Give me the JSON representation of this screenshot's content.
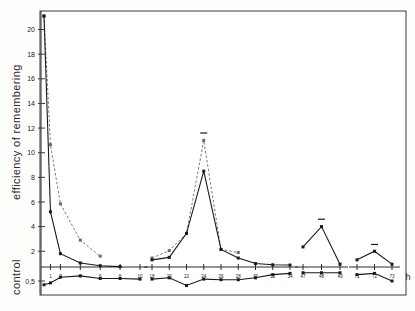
{
  "chart_data": {
    "type": "line",
    "title": "",
    "xlabel": "h",
    "ylabel": "efficiency of remembering",
    "control_label": "control",
    "ylim": [
      0.3,
      21.5
    ],
    "y_ticks": [
      "20",
      "18",
      "16",
      "14",
      "12",
      "10",
      "8",
      "6",
      "4",
      "2"
    ],
    "y_tick_values": [
      20,
      18,
      16,
      14,
      12,
      10,
      8,
      6,
      4,
      2
    ],
    "control_tick": "0,5",
    "control_tick_value": 0.5,
    "grid": false,
    "legend": [],
    "segments": [
      {
        "name": "segment-1",
        "x_ticks": [
          "1",
          "2",
          "4",
          "6",
          "8",
          "10"
        ],
        "x_tick_values": [
          1,
          2,
          4,
          6,
          8,
          10
        ]
      },
      {
        "name": "segment-2",
        "x_ticks": [
          "18",
          "20",
          "22",
          "24",
          "26",
          "28",
          "30",
          "32",
          "34"
        ],
        "x_tick_values": [
          18,
          20,
          22,
          24,
          26,
          28,
          30,
          32,
          34
        ]
      },
      {
        "name": "segment-3",
        "x_ticks": [
          "47",
          "48",
          "49"
        ],
        "x_tick_values": [
          47,
          48,
          49
        ]
      },
      {
        "name": "segment-4",
        "x_ticks": [
          "71",
          "72",
          "73"
        ],
        "x_tick_values": [
          71,
          72,
          73
        ]
      }
    ],
    "series": [
      {
        "name": "dashed-series",
        "style": "dashed",
        "color": "#6a6a6a",
        "points": [
          {
            "x": 0.35,
            "y": 21.1
          },
          {
            "x": 1,
            "y": 10.65
          },
          {
            "x": 2,
            "y": 5.85
          },
          {
            "x": 4,
            "y": 2.9
          },
          {
            "x": 6,
            "y": 1.6
          },
          {
            "x": 18,
            "y": 1.45
          },
          {
            "x": 20,
            "y": 2.05
          },
          {
            "x": 22,
            "y": 3.45
          },
          {
            "x": 24,
            "y": 11.0
          },
          {
            "x": 26,
            "y": 2.15
          },
          {
            "x": 28,
            "y": 1.9
          }
        ]
      },
      {
        "name": "solid-series",
        "style": "solid",
        "color": "#1a1a1a",
        "points": [
          {
            "x": 0.35,
            "y": 21.1
          },
          {
            "x": 1,
            "y": 5.2
          },
          {
            "x": 2,
            "y": 1.8
          },
          {
            "x": 4,
            "y": 1.05
          },
          {
            "x": 6,
            "y": 0.82
          },
          {
            "x": 8,
            "y": 0.75
          },
          {
            "x": 18,
            "y": 1.3
          },
          {
            "x": 20,
            "y": 1.5
          },
          {
            "x": 22,
            "y": 3.45
          },
          {
            "x": 24,
            "y": 8.5
          },
          {
            "x": 26,
            "y": 2.15
          },
          {
            "x": 28,
            "y": 1.45
          },
          {
            "x": 30,
            "y": 1.0
          },
          {
            "x": 32,
            "y": 0.9
          },
          {
            "x": 34,
            "y": 0.88
          },
          {
            "x": 47,
            "y": 2.35
          },
          {
            "x": 48,
            "y": 4.0
          },
          {
            "x": 49,
            "y": 0.95
          },
          {
            "x": 71,
            "y": 1.3
          },
          {
            "x": 72,
            "y": 2.0
          },
          {
            "x": 73,
            "y": 0.95
          }
        ]
      },
      {
        "name": "control-series",
        "style": "solid",
        "color": "#1a1a1a",
        "points": [
          {
            "x": 0.35,
            "y": 0.44
          },
          {
            "x": 1,
            "y": 0.47
          },
          {
            "x": 2,
            "y": 0.56
          },
          {
            "x": 4,
            "y": 0.58
          },
          {
            "x": 6,
            "y": 0.54
          },
          {
            "x": 8,
            "y": 0.54
          },
          {
            "x": 10,
            "y": 0.53
          },
          {
            "x": 18,
            "y": 0.53
          },
          {
            "x": 20,
            "y": 0.55
          },
          {
            "x": 22,
            "y": 0.43
          },
          {
            "x": 24,
            "y": 0.53
          },
          {
            "x": 26,
            "y": 0.52
          },
          {
            "x": 28,
            "y": 0.52
          },
          {
            "x": 30,
            "y": 0.55
          },
          {
            "x": 32,
            "y": 0.6
          },
          {
            "x": 34,
            "y": 0.62
          },
          {
            "x": 47,
            "y": 0.63
          },
          {
            "x": 48,
            "y": 0.63
          },
          {
            "x": 49,
            "y": 0.63
          },
          {
            "x": 71,
            "y": 0.6
          },
          {
            "x": 72,
            "y": 0.62
          },
          {
            "x": 73,
            "y": 0.5
          }
        ]
      }
    ],
    "error_bar_markers": [
      {
        "x": 24,
        "y": 11.6
      },
      {
        "x": 48,
        "y": 4.6
      },
      {
        "x": 72,
        "y": 2.55
      }
    ],
    "axis_line_value": 0.72
  }
}
